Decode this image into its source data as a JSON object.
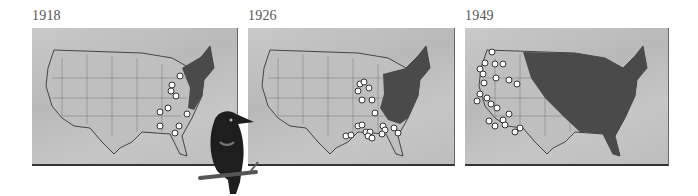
{
  "figure": {
    "panels": [
      {
        "year": "1918",
        "range_description": "Northeastern United States (New England to Mid-Atlantic)",
        "sighting_markers": 10
      },
      {
        "year": "1926",
        "range_description": "Eastern United States east of the Appalachians/Mississippi",
        "sighting_markers": 20
      },
      {
        "year": "1949",
        "range_description": "Most of the United States east of the Rockies",
        "sighting_markers": 22
      }
    ],
    "illustration": "starling perched on branch",
    "colors": {
      "background": "#ffffff",
      "map_base": "#c4c4c4",
      "range_fill": "#4a4a4a",
      "marker_fill": "#ffffff",
      "marker_center": "#333333",
      "frame_border": "#333333",
      "year_text": "#555555"
    }
  }
}
